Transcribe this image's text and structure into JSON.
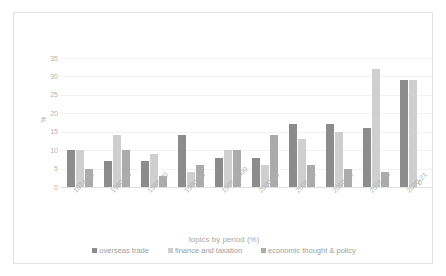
{
  "chart_data": {
    "type": "bar",
    "title": "",
    "xlabel": "topics by period (%)",
    "ylabel": "%",
    "ylim": [
      0,
      35
    ],
    "yticks": [
      0,
      5,
      10,
      15,
      20,
      25,
      30,
      35
    ],
    "grid": true,
    "legend_position": "bottom",
    "categories": [
      "1974-80",
      "1980-85",
      "1985-90",
      "1990-95",
      "1995-2000",
      "2000-05",
      "2005-10",
      "2010-15",
      "2015-20",
      "2020-21"
    ],
    "series": [
      {
        "name": "overseas trade",
        "color": "#8c8c8c",
        "values": [
          10,
          7,
          7,
          14,
          8,
          8,
          17,
          17,
          16,
          29
        ]
      },
      {
        "name": "finance and taxation",
        "color": "#cfcfcf",
        "values": [
          10,
          14,
          9,
          4,
          10,
          6,
          13,
          15,
          32,
          29
        ]
      },
      {
        "name": "economic thought & policy",
        "color": "#ababab",
        "values": [
          5,
          10,
          3,
          6,
          10,
          14,
          6,
          5,
          4,
          0
        ]
      }
    ],
    "data_labels": [
      {
        "category": "2020-21",
        "series": "economic thought & policy",
        "text": "0"
      }
    ]
  }
}
